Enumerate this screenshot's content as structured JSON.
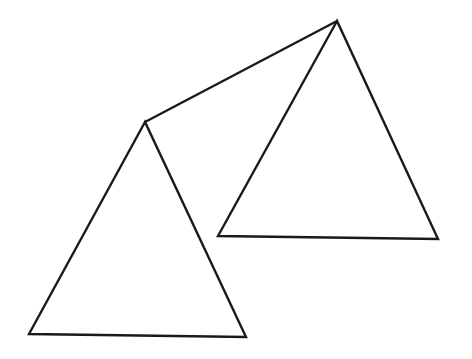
{
  "figure": {
    "background_color": "#ffffff",
    "stroke_color": "#1a1a1a",
    "stroke_width": 2.4,
    "canvas": {
      "width": 472,
      "height": 359
    },
    "shapes": [
      {
        "id": "triangle-left",
        "label": "Left triangle",
        "type": "triangle",
        "fill": "none",
        "stroke": "#1a1a1a",
        "stroke_width": 2.4,
        "points": "145,122 29,334 246,337",
        "vertices": [
          {
            "name": "apex",
            "x": 145,
            "y": 122
          },
          {
            "name": "bottom-left",
            "x": 29,
            "y": 334
          },
          {
            "name": "bottom-right",
            "x": 246,
            "y": 337
          }
        ]
      },
      {
        "id": "triangle-right",
        "label": "Right triangle",
        "type": "triangle",
        "fill": "none",
        "stroke": "#1a1a1a",
        "stroke_width": 2.4,
        "points": "337,21 218,236 438,239",
        "vertices": [
          {
            "name": "apex",
            "x": 337,
            "y": 21
          },
          {
            "name": "bottom-left",
            "x": 218,
            "y": 236
          },
          {
            "name": "bottom-right",
            "x": 438,
            "y": 239
          }
        ]
      },
      {
        "id": "connector-line",
        "label": "Line joining left apex to right apex",
        "type": "line",
        "stroke": "#1a1a1a",
        "stroke_width": 2.4,
        "x1": 145,
        "y1": 122,
        "x2": 337,
        "y2": 21
      }
    ]
  }
}
